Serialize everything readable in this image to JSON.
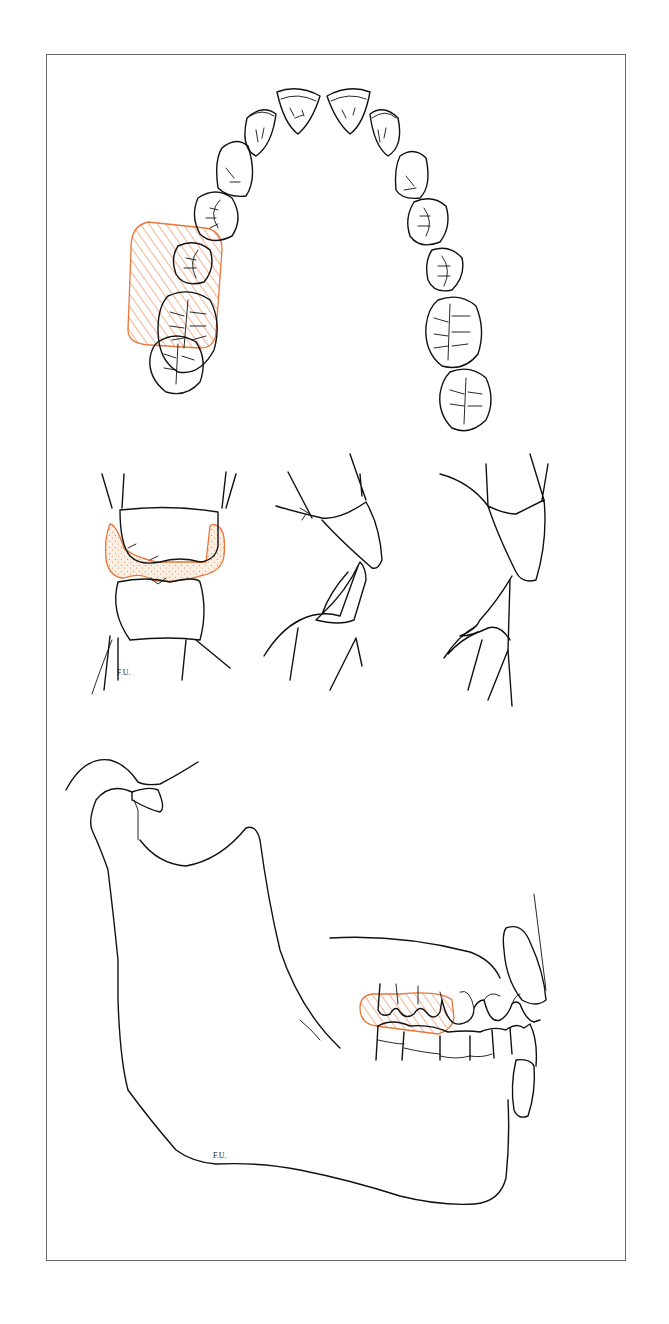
{
  "figure": {
    "panels": [
      {
        "id": "occlusal-arch",
        "label": "Occlusal view of maxillary dental arch",
        "highlight": "first and second molars (right side of image-left)"
      },
      {
        "id": "tooth-contact-sections",
        "label": "Cross-sectional tooth contact views",
        "count": 3,
        "highlight": "posterior tooth contact zone (left section)"
      },
      {
        "id": "mandible-profile",
        "label": "Lateral view of mandible with occlusion",
        "highlight": "posterior molar occlusion"
      }
    ],
    "signatures": [
      "F.U.",
      "F.U."
    ],
    "colors": {
      "ink": "#111111",
      "highlight": "#E8753A",
      "highlight_fill": "#F6D9C4",
      "frame": "#6a6a6a"
    }
  }
}
